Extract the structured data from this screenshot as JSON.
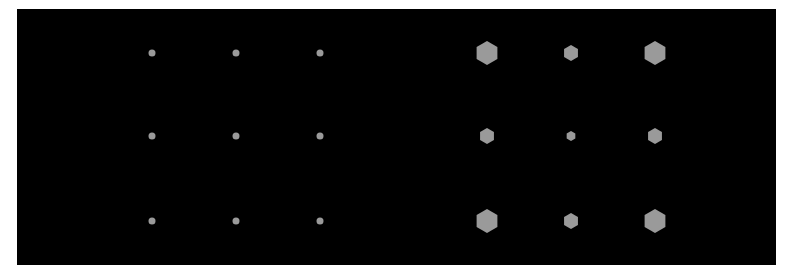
{
  "panel": {
    "background": "#000000",
    "x": 17,
    "y": 9,
    "width": 759,
    "height": 256
  },
  "colors": {
    "shape_fill": "#9a9a9a",
    "page_background": "#ffffff"
  },
  "dot_grid": {
    "shape": "circle",
    "radius": 3.5,
    "columns_x": [
      152,
      236,
      320
    ],
    "rows_y": [
      53,
      136,
      221
    ]
  },
  "hex_grid": {
    "shape": "hexagon",
    "columns_x": [
      487,
      571,
      655
    ],
    "rows_y": [
      53,
      136,
      221
    ],
    "sizes": [
      [
        12,
        8,
        12
      ],
      [
        8,
        5,
        8
      ],
      [
        12,
        8,
        12
      ]
    ]
  }
}
